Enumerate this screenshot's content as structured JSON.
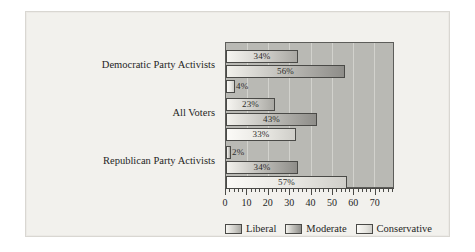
{
  "chart_data": {
    "type": "bar",
    "orientation": "horizontal",
    "title": "",
    "xlabel": "",
    "ylabel": "",
    "xlim": [
      0,
      79
    ],
    "grid": true,
    "legend_position": "bottom",
    "categories": [
      "Democratic Party Activists",
      "All Voters",
      "Republican Party Activists"
    ],
    "series": [
      {
        "name": "Liberal",
        "values": [
          34,
          23,
          2
        ],
        "labels": [
          "34%",
          "23%",
          "2%"
        ]
      },
      {
        "name": "Moderate",
        "values": [
          56,
          43,
          34
        ],
        "labels": [
          "56%",
          "43%",
          "34%"
        ]
      },
      {
        "name": "Conservative",
        "values": [
          4,
          33,
          57
        ],
        "labels": [
          "4%",
          "33%",
          "57%"
        ]
      }
    ],
    "xticks": [
      0,
      10,
      20,
      30,
      40,
      50,
      60,
      70
    ],
    "xtick_labels": [
      "0",
      "10",
      "20",
      "30",
      "40",
      "50",
      "60",
      "70"
    ],
    "minor_tick_step": 2,
    "colors": {
      "plot_background": "#b9b9b4",
      "page_background": "#f2f1ed",
      "bar_outline": "#4a4a47",
      "gridline": "#d6d6d1",
      "liberal": "#cfcec9",
      "moderate": "#c2c1bc",
      "conservative": "#e6e5e0"
    }
  },
  "legend": {
    "items": [
      {
        "label": "Liberal"
      },
      {
        "label": "Moderate"
      },
      {
        "label": "Conservative"
      }
    ]
  }
}
